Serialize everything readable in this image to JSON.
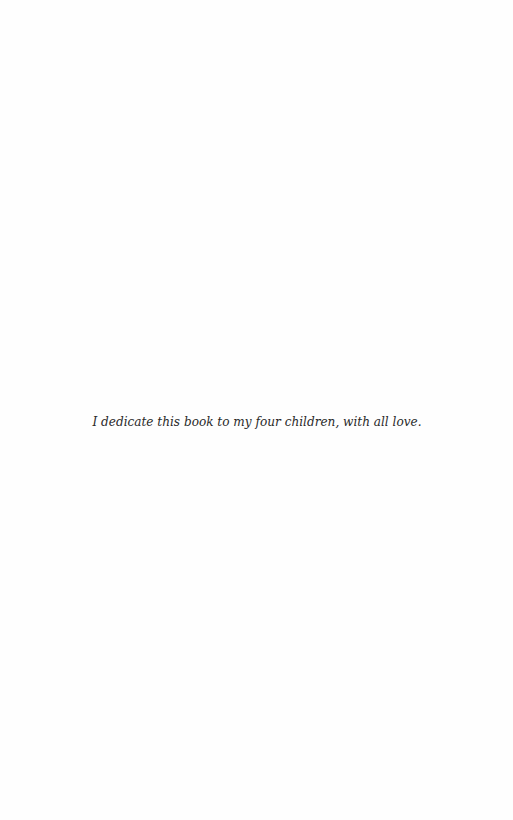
{
  "page": {
    "type": "dedication-page",
    "dedication_text": "I dedicate this book to my four children, with all love."
  }
}
